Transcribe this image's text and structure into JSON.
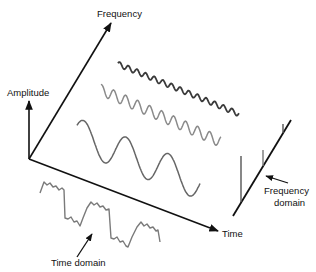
{
  "diagram": {
    "colors": {
      "axis": "#111111",
      "wave_high": "#3a3a3a",
      "wave_mid": "#8a8a8a",
      "wave_low": "#666666",
      "composite": "#7a7a7a",
      "text": "#111111"
    },
    "axes": {
      "frequency_label": "Frequency",
      "amplitude_label": "Amplitude",
      "time_label": "Time"
    },
    "annotations": {
      "time_domain_label": "Time domain",
      "frequency_domain_label_line1": "Frequency",
      "frequency_domain_label_line2": "domain"
    },
    "components": [
      {
        "name": "high-frequency sine",
        "cycles": 14,
        "amplitude": "small"
      },
      {
        "name": "medium-frequency sine",
        "cycles": 10,
        "amplitude": "medium"
      },
      {
        "name": "low-frequency sine",
        "cycles": 3,
        "amplitude": "large"
      }
    ],
    "frequency_domain_spikes": [
      {
        "component": "low-frequency",
        "height": "large"
      },
      {
        "component": "medium-frequency",
        "height": "medium"
      },
      {
        "component": "high-frequency",
        "height": "small"
      }
    ]
  }
}
